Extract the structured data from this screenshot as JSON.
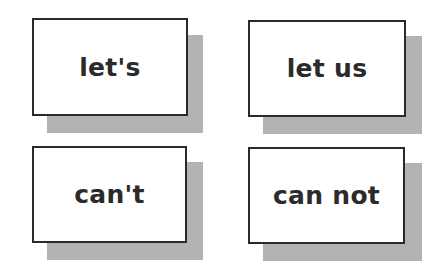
{
  "cards": [
    {
      "label": "let's"
    },
    {
      "label": "let us"
    },
    {
      "label": "can't"
    },
    {
      "label": "can not"
    }
  ],
  "colors": {
    "card_border": "#2a2a2a",
    "card_fill": "#ffffff",
    "shadow": "#b3b3b3",
    "text": "#2b2b2b"
  }
}
